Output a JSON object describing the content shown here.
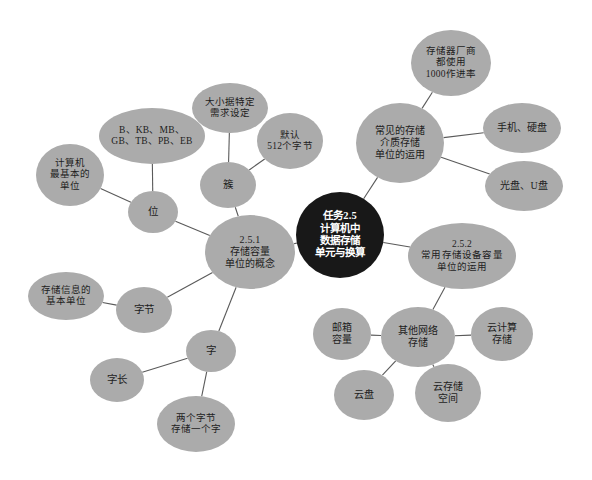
{
  "diagram": {
    "type": "mind-map",
    "background_color": "#ffffff",
    "node_color": "#ababab",
    "center_node_color": "#181818",
    "edge_color": "#5a5a5a"
  },
  "nodes": [
    {
      "id": "center",
      "label": "任务2.5\n计算机中\n数据存储\n单元与换算",
      "x": 340,
      "y": 235,
      "w": 88,
      "h": 86,
      "font_size": 10.5,
      "kind": "center"
    },
    {
      "id": "sec251",
      "label": "2.5.1\n存储容量\n单位的概念",
      "x": 250,
      "y": 252,
      "w": 90,
      "h": 74,
      "font_size": 10,
      "kind": "branch"
    },
    {
      "id": "sec252",
      "label": "2.5.2\n常用存储设备容量\n单位的运用",
      "x": 462,
      "y": 256,
      "w": 108,
      "h": 66,
      "font_size": 9.5,
      "kind": "branch"
    },
    {
      "id": "media",
      "label": "常见的存储\n介质存储\n单位的运用",
      "x": 400,
      "y": 143,
      "w": 88,
      "h": 80,
      "font_size": 10,
      "kind": "branch"
    },
    {
      "id": "vendor",
      "label": "存储器厂商\n都使用\n1000作进率",
      "x": 451,
      "y": 63,
      "w": 80,
      "h": 66,
      "font_size": 9.5,
      "kind": "leaf"
    },
    {
      "id": "phone-disk",
      "label": "手机、硬盘",
      "x": 522,
      "y": 128,
      "w": 78,
      "h": 50,
      "font_size": 10,
      "kind": "leaf"
    },
    {
      "id": "cd-usb",
      "label": "光盘、U盘",
      "x": 524,
      "y": 186,
      "w": 78,
      "h": 50,
      "font_size": 10,
      "kind": "leaf"
    },
    {
      "id": "net-storage",
      "label": "其他网络\n存储",
      "x": 418,
      "y": 337,
      "w": 74,
      "h": 60,
      "font_size": 10,
      "kind": "leaf"
    },
    {
      "id": "mailbox",
      "label": "邮箱\n容量",
      "x": 342,
      "y": 334,
      "w": 58,
      "h": 52,
      "font_size": 10,
      "kind": "leaf"
    },
    {
      "id": "cloud-compute",
      "label": "云计算\n存储",
      "x": 502,
      "y": 334,
      "w": 62,
      "h": 54,
      "font_size": 10,
      "kind": "leaf"
    },
    {
      "id": "cloud-space",
      "label": "云存储\n空间",
      "x": 448,
      "y": 393,
      "w": 66,
      "h": 58,
      "font_size": 10,
      "kind": "leaf"
    },
    {
      "id": "cloud-disk",
      "label": "云盘",
      "x": 364,
      "y": 395,
      "w": 60,
      "h": 50,
      "font_size": 10,
      "kind": "leaf"
    },
    {
      "id": "cluster",
      "label": "簇",
      "x": 228,
      "y": 185,
      "w": 56,
      "h": 46,
      "font_size": 10.5,
      "kind": "leaf"
    },
    {
      "id": "default-512",
      "label": "默认\n512个字节",
      "x": 290,
      "y": 141,
      "w": 66,
      "h": 56,
      "font_size": 9.5,
      "kind": "leaf"
    },
    {
      "id": "size-demand",
      "label": "大小据特定\n需求设定",
      "x": 230,
      "y": 108,
      "w": 76,
      "h": 50,
      "font_size": 9.5,
      "kind": "leaf"
    },
    {
      "id": "units",
      "label": "B、KB、MB、\nGB、TB、PB、EB",
      "x": 152,
      "y": 136,
      "w": 106,
      "h": 56,
      "font_size": 9.5,
      "kind": "leaf"
    },
    {
      "id": "bit",
      "label": "位",
      "x": 153,
      "y": 212,
      "w": 50,
      "h": 42,
      "font_size": 10.5,
      "kind": "leaf"
    },
    {
      "id": "basic-unit",
      "label": "计算机\n最基本的\n单位",
      "x": 70,
      "y": 175,
      "w": 68,
      "h": 62,
      "font_size": 9.5,
      "kind": "leaf"
    },
    {
      "id": "byte",
      "label": "字节",
      "x": 144,
      "y": 310,
      "w": 56,
      "h": 46,
      "font_size": 10.5,
      "kind": "leaf"
    },
    {
      "id": "info-basic",
      "label": "存储信息的\n基本单位",
      "x": 66,
      "y": 296,
      "w": 76,
      "h": 48,
      "font_size": 9.5,
      "kind": "leaf"
    },
    {
      "id": "word",
      "label": "字",
      "x": 211,
      "y": 351,
      "w": 50,
      "h": 42,
      "font_size": 10.5,
      "kind": "leaf"
    },
    {
      "id": "word-length",
      "label": "字长",
      "x": 117,
      "y": 380,
      "w": 54,
      "h": 44,
      "font_size": 10.5,
      "kind": "leaf"
    },
    {
      "id": "two-bytes",
      "label": "两个字节\n存储一个字",
      "x": 196,
      "y": 424,
      "w": 78,
      "h": 56,
      "font_size": 9.5,
      "kind": "leaf"
    }
  ],
  "edges": [
    {
      "from": "center",
      "to": "sec251"
    },
    {
      "from": "center",
      "to": "sec252"
    },
    {
      "from": "center",
      "to": "media"
    },
    {
      "from": "media",
      "to": "vendor"
    },
    {
      "from": "media",
      "to": "phone-disk"
    },
    {
      "from": "media",
      "to": "cd-usb"
    },
    {
      "from": "sec252",
      "to": "net-storage"
    },
    {
      "from": "net-storage",
      "to": "mailbox"
    },
    {
      "from": "net-storage",
      "to": "cloud-compute"
    },
    {
      "from": "net-storage",
      "to": "cloud-space"
    },
    {
      "from": "net-storage",
      "to": "cloud-disk"
    },
    {
      "from": "sec251",
      "to": "cluster"
    },
    {
      "from": "cluster",
      "to": "default-512"
    },
    {
      "from": "cluster",
      "to": "size-demand"
    },
    {
      "from": "sec251",
      "to": "bit"
    },
    {
      "from": "bit",
      "to": "units"
    },
    {
      "from": "bit",
      "to": "basic-unit"
    },
    {
      "from": "sec251",
      "to": "byte"
    },
    {
      "from": "byte",
      "to": "info-basic"
    },
    {
      "from": "sec251",
      "to": "word"
    },
    {
      "from": "word",
      "to": "word-length"
    },
    {
      "from": "word",
      "to": "two-bytes"
    }
  ]
}
